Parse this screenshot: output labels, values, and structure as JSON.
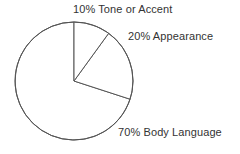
{
  "chart_data": {
    "type": "pie",
    "title": "",
    "categories": [
      "Tone or Accent",
      "Appearance",
      "Body Language"
    ],
    "values": [
      10,
      20,
      70
    ],
    "value_unit": "%",
    "labels": [
      "10% Tone or Accent",
      "20% Appearance",
      "70% Body Language"
    ],
    "slices": [
      {
        "label": "10% Tone or Accent",
        "name": "Tone or Accent",
        "value": 10,
        "start_angle_deg": 0,
        "end_angle_deg": 36,
        "fill": "#ffffff",
        "stroke": "#555555"
      },
      {
        "label": "20% Appearance",
        "name": "Appearance",
        "value": 20,
        "start_angle_deg": 36,
        "end_angle_deg": 108,
        "fill": "#ffffff",
        "stroke": "#555555"
      },
      {
        "label": "70% Body Language",
        "name": "Body Language",
        "value": 70,
        "start_angle_deg": 108,
        "end_angle_deg": 360,
        "fill": "#ffffff",
        "stroke": "#555555"
      }
    ],
    "geometry": {
      "center_x": 74,
      "center_y": 81,
      "radius": 59,
      "start_angle_deg": 0,
      "direction": "clockwise"
    },
    "legend": "none",
    "grid": false,
    "background": "#ffffff",
    "line_color": "#555555",
    "text_color": "#333333"
  }
}
